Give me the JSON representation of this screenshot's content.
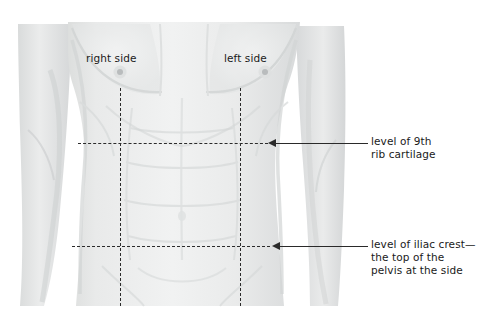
{
  "figure": {
    "background_color": "#ffffff",
    "skin_color": "#e8e9e9",
    "shadow_color": "#d6d8d8",
    "line_color": "#2b2b2b"
  },
  "side_labels": [
    {
      "id": "right-side",
      "text": "right side"
    },
    {
      "id": "left-side",
      "text": "left side"
    }
  ],
  "callouts": [
    {
      "id": "ninth-rib-cartilage",
      "lines": [
        "level of 9th",
        "rib cartilage"
      ]
    },
    {
      "id": "iliac-crest",
      "lines": [
        "level of iliac crest—",
        "the top of the",
        "pelvis at the side"
      ]
    }
  ],
  "guides": {
    "vertical": [
      {
        "id": "right-midclavicular-line",
        "label": "right vertical guide"
      },
      {
        "id": "left-midclavicular-line",
        "label": "left vertical guide"
      }
    ],
    "horizontal": [
      {
        "id": "ninth-rib-level-line",
        "label": "level of 9th rib cartilage"
      },
      {
        "id": "iliac-crest-level-line",
        "label": "level of iliac crest"
      }
    ]
  },
  "anatomy": {
    "nipples": [
      "right nipple",
      "left nipple"
    ]
  }
}
